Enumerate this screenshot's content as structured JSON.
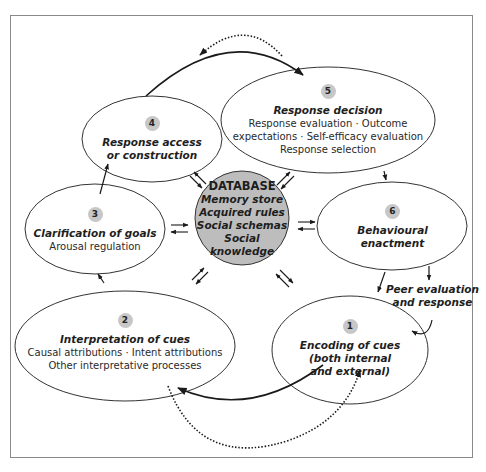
{
  "diagram": {
    "type": "cyclical process model",
    "center": {
      "heading": "DATABASE",
      "items": [
        "Memory store",
        "Acquired rules",
        "Social schemas",
        "Social knowledge"
      ],
      "fill": "#bdbdbd"
    },
    "nodes": [
      {
        "number": "1",
        "title_lines": [
          "Encoding of cues",
          "(both internal",
          "and external)"
        ],
        "details": []
      },
      {
        "number": "2",
        "title_lines": [
          "Interpretation of cues"
        ],
        "details": [
          "Causal attributions · Intent attributions",
          "Other interpretative processes"
        ]
      },
      {
        "number": "3",
        "title_lines": [
          "Clarification of goals"
        ],
        "details": [
          "Arousal regulation"
        ]
      },
      {
        "number": "4",
        "title_lines": [
          "Response access",
          "or construction"
        ],
        "details": []
      },
      {
        "number": "5",
        "title_lines": [
          "Response decision"
        ],
        "details": [
          "Response evaluation · Outcome",
          "expectations · Self-efficacy evaluation",
          "Response selection"
        ]
      },
      {
        "number": "6",
        "title_lines": [
          "Behavioural",
          "enactment"
        ],
        "details": []
      }
    ],
    "side_label": {
      "lines": [
        "Peer evaluation",
        "and response"
      ]
    },
    "edges": [
      {
        "from": "1",
        "to": "2",
        "style": "solid"
      },
      {
        "from": "2",
        "to": "3",
        "style": "solid"
      },
      {
        "from": "3",
        "to": "4",
        "style": "solid"
      },
      {
        "from": "4",
        "to": "5",
        "style": "solid"
      },
      {
        "from": "5",
        "to": "6",
        "style": "solid"
      },
      {
        "from": "6",
        "to": "1",
        "style": "solid"
      },
      {
        "from": "6",
        "to": "Peer evaluation and response",
        "style": "solid"
      },
      {
        "from": "Peer evaluation and response",
        "to": "1",
        "style": "solid"
      },
      {
        "from": "5",
        "to": "4",
        "style": "dotted"
      },
      {
        "from": "2",
        "to": "1",
        "style": "dotted"
      },
      {
        "between": [
          "DATABASE",
          "1"
        ],
        "style": "bidirectional"
      },
      {
        "between": [
          "DATABASE",
          "2"
        ],
        "style": "bidirectional"
      },
      {
        "between": [
          "DATABASE",
          "3"
        ],
        "style": "bidirectional"
      },
      {
        "between": [
          "DATABASE",
          "4"
        ],
        "style": "bidirectional"
      },
      {
        "between": [
          "DATABASE",
          "5"
        ],
        "style": "bidirectional"
      },
      {
        "between": [
          "DATABASE",
          "6"
        ],
        "style": "bidirectional"
      }
    ],
    "colors": {
      "stroke": "#1a1a1a",
      "badge": "#c7c7c7",
      "frame": "#8a8a8a"
    }
  }
}
